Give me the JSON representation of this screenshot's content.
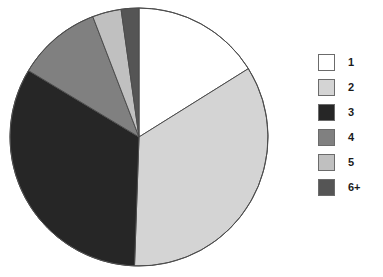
{
  "chart_data": {
    "type": "pie",
    "title": "",
    "subtitle": "",
    "xlabel": "",
    "ylabel": "",
    "grid": false,
    "legend_position": "right",
    "start_angle_deg": 0,
    "direction": "clockwise",
    "center": {
      "x": 139,
      "y": 137
    },
    "radius": 129,
    "categories": [
      "1",
      "2",
      "3",
      "4",
      "5",
      "6+"
    ],
    "values": [
      16.0,
      34.5,
      33.0,
      10.5,
      3.5,
      2.5
    ],
    "value_unit": "percent",
    "slice_start_angles_deg": [
      0,
      58,
      182,
      301,
      339,
      352
    ],
    "slice_end_angles_deg": [
      58,
      182,
      301,
      339,
      352,
      360
    ],
    "colors": [
      "#ffffff",
      "#d4d4d4",
      "#262626",
      "#808080",
      "#c0c0c0",
      "#555555"
    ],
    "outline_color": "#4d4d4d",
    "slices": [
      {
        "label": "1",
        "value": 16.0,
        "color": "#ffffff"
      },
      {
        "label": "2",
        "value": 34.5,
        "color": "#d4d4d4"
      },
      {
        "label": "3",
        "value": 33.0,
        "color": "#262626"
      },
      {
        "label": "4",
        "value": 10.5,
        "color": "#808080"
      },
      {
        "label": "5",
        "value": 3.5,
        "color": "#c0c0c0"
      },
      {
        "label": "6+",
        "value": 2.5,
        "color": "#555555"
      }
    ]
  },
  "legend": {
    "items": [
      {
        "label": "1",
        "color": "#ffffff"
      },
      {
        "label": "2",
        "color": "#d4d4d4"
      },
      {
        "label": "3",
        "color": "#262626"
      },
      {
        "label": "4",
        "color": "#808080"
      },
      {
        "label": "5",
        "color": "#c0c0c0"
      },
      {
        "label": "6+",
        "color": "#555555"
      }
    ]
  }
}
